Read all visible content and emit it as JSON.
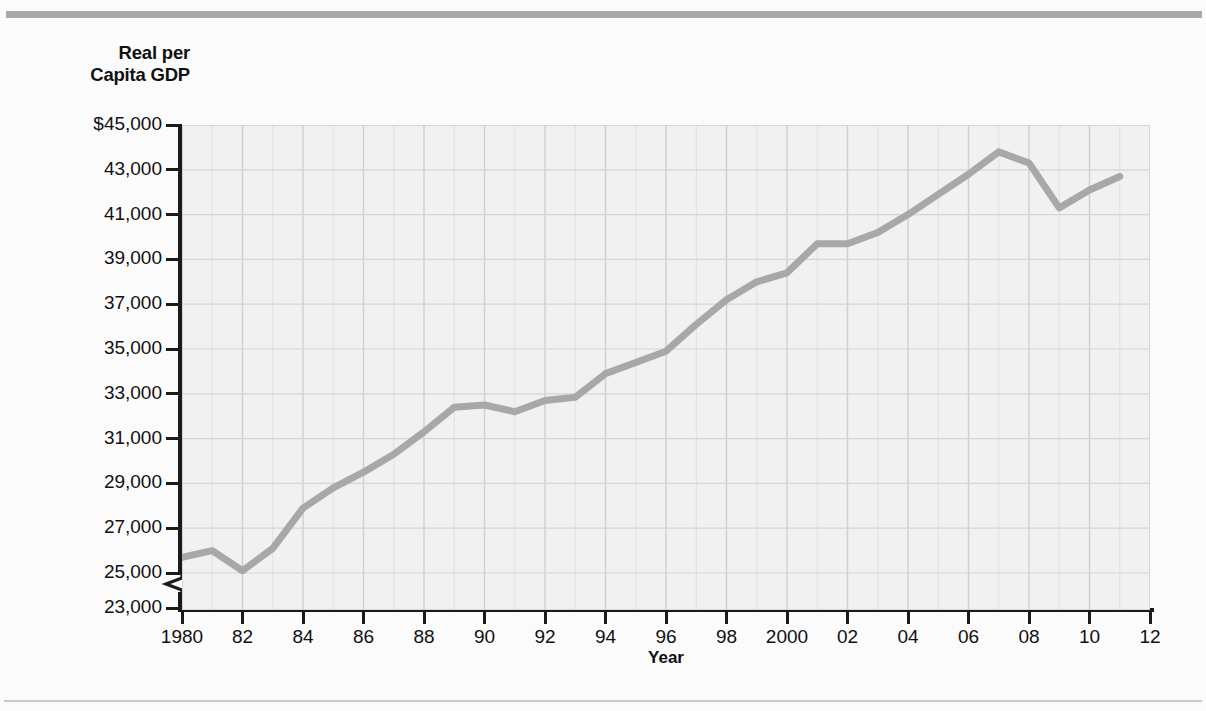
{
  "chart_data": {
    "type": "line",
    "title": "",
    "ylabel": "Real per\nCapita GDP",
    "ylabel_line1": "Real per",
    "ylabel_line2": "Capita GDP",
    "xlabel": "Year",
    "grid": true,
    "legend": "none",
    "series_color": "#a8a8a8",
    "plot_background": "#f1f1f1",
    "gridline_color": "#d9d9d9",
    "axis_color": "#1a1a1a",
    "axis_break": true,
    "axis_break_between": [
      23000,
      25000
    ],
    "ylim": [
      23000,
      45000
    ],
    "yticks": [
      45000,
      43000,
      41000,
      39000,
      37000,
      35000,
      33000,
      31000,
      29000,
      27000,
      25000,
      23000
    ],
    "ytick_labels": [
      "$45,000",
      "43,000",
      "41,000",
      "39,000",
      "37,000",
      "35,000",
      "33,000",
      "31,000",
      "29,000",
      "27,000",
      "25,000",
      "23,000"
    ],
    "xlim": [
      1980,
      2012
    ],
    "xticks": [
      1980,
      1982,
      1984,
      1986,
      1988,
      1990,
      1992,
      1994,
      1996,
      1998,
      2000,
      2002,
      2004,
      2006,
      2008,
      2010,
      2012
    ],
    "xtick_labels": [
      "1980",
      "82",
      "84",
      "86",
      "88",
      "90",
      "92",
      "94",
      "96",
      "98",
      "2000",
      "02",
      "04",
      "06",
      "08",
      "10",
      "12"
    ],
    "x": [
      1980,
      1981,
      1982,
      1983,
      1984,
      1985,
      1986,
      1987,
      1988,
      1989,
      1990,
      1991,
      1992,
      1993,
      1994,
      1995,
      1996,
      1997,
      1998,
      1999,
      2000,
      2001,
      2002,
      2003,
      2004,
      2005,
      2006,
      2007,
      2008,
      2009,
      2010,
      2011
    ],
    "values": [
      25700,
      26000,
      25100,
      26100,
      27900,
      28800,
      29500,
      30300,
      31300,
      32400,
      32500,
      32200,
      32700,
      32850,
      33900,
      34400,
      34900,
      36100,
      37200,
      38000,
      38400,
      39700,
      39700,
      40200,
      41000,
      41900,
      42800,
      43800,
      43300,
      41300,
      42100,
      42700
    ],
    "series_name": "Real per Capita GDP"
  }
}
